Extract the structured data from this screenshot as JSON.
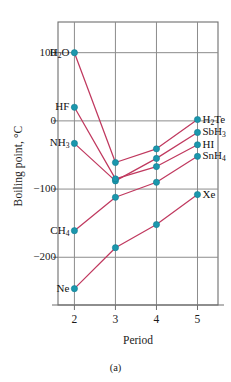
{
  "figure": {
    "caption": "(a)"
  },
  "axes": {
    "ylabel": "Boiling point, °C",
    "xlabel": "Period",
    "yticks": [
      "100",
      "0",
      "−100",
      "−200"
    ],
    "ytick_values": [
      100,
      0,
      -100,
      -200
    ],
    "xticks": [
      "2",
      "3",
      "4",
      "5"
    ],
    "xtick_values": [
      2,
      3,
      4,
      5
    ]
  },
  "colors": {
    "line": "#c0395f",
    "marker": "#1b97ad",
    "marker_edge": "#0f7c90",
    "grid": "#8c8c8c",
    "frame": "#6e6e6e",
    "text": "#1a1a1a",
    "background": "#ffffff"
  },
  "labels": {
    "left": [
      {
        "text": "H2O",
        "html": "H<sub>2</sub>O",
        "x": 2,
        "y": 100
      },
      {
        "text": "HF",
        "html": "HF",
        "x": 2,
        "y": 20
      },
      {
        "text": "NH3",
        "html": "NH<sub>3</sub>",
        "x": 2,
        "y": -33
      },
      {
        "text": "CH4",
        "html": "CH<sub>4</sub>",
        "x": 2,
        "y": -161
      },
      {
        "text": "Ne",
        "html": "Ne",
        "x": 2,
        "y": -246
      }
    ],
    "right": [
      {
        "text": "H2Te",
        "html": "H<sub>2</sub>Te",
        "x": 5,
        "y": 2
      },
      {
        "text": "SbH3",
        "html": "SbH<sub>3</sub>",
        "x": 5,
        "y": -17
      },
      {
        "text": "HI",
        "html": "HI",
        "x": 5,
        "y": -35
      },
      {
        "text": "SnH4",
        "html": "SnH<sub>4</sub>",
        "x": 5,
        "y": -52
      },
      {
        "text": "Xe",
        "html": "Xe",
        "x": 5,
        "y": -108
      }
    ]
  },
  "chart_data": {
    "type": "line",
    "title": "",
    "subtitle": "",
    "xlabel": "Period",
    "ylabel": "Boiling point, °C",
    "xlim": [
      1.6,
      5.5
    ],
    "ylim": [
      -270,
      145
    ],
    "grid": true,
    "legend": "none",
    "x": [
      2,
      3,
      4,
      5
    ],
    "series": [
      {
        "name": "Group 16 hydrides",
        "endpoint_label": "H2Te",
        "start_label": "H2O",
        "values": [
          100,
          -61,
          -41,
          2
        ],
        "points": [
          {
            "x": 2,
            "y": 100,
            "label": "H2O"
          },
          {
            "x": 3,
            "y": -61,
            "label": "H2S"
          },
          {
            "x": 4,
            "y": -41,
            "label": "H2Se"
          },
          {
            "x": 5,
            "y": 2,
            "label": "H2Te"
          }
        ]
      },
      {
        "name": "Group 15 hydrides",
        "endpoint_label": "SbH3",
        "start_label": "NH3",
        "values": [
          -33,
          -88,
          -55,
          -17
        ],
        "points": [
          {
            "x": 2,
            "y": -33,
            "label": "NH3"
          },
          {
            "x": 3,
            "y": -88,
            "label": "PH3"
          },
          {
            "x": 4,
            "y": -55,
            "label": "AsH3"
          },
          {
            "x": 5,
            "y": -17,
            "label": "SbH3"
          }
        ]
      },
      {
        "name": "Group 17 hydrides",
        "endpoint_label": "HI",
        "start_label": "HF",
        "values": [
          20,
          -85,
          -67,
          -35
        ],
        "points": [
          {
            "x": 2,
            "y": 20,
            "label": "HF"
          },
          {
            "x": 3,
            "y": -85,
            "label": "HCl"
          },
          {
            "x": 4,
            "y": -67,
            "label": "HBr"
          },
          {
            "x": 5,
            "y": -35,
            "label": "HI"
          }
        ]
      },
      {
        "name": "Group 14 hydrides",
        "endpoint_label": "SnH4",
        "start_label": "CH4",
        "values": [
          -161,
          -112,
          -90,
          -52
        ],
        "points": [
          {
            "x": 2,
            "y": -161,
            "label": "CH4"
          },
          {
            "x": 3,
            "y": -112,
            "label": "SiH4"
          },
          {
            "x": 4,
            "y": -90,
            "label": "GeH4"
          },
          {
            "x": 5,
            "y": -52,
            "label": "SnH4"
          }
        ]
      },
      {
        "name": "Noble gases",
        "endpoint_label": "Xe",
        "start_label": "Ne",
        "values": [
          -246,
          -186,
          -152,
          -108
        ],
        "points": [
          {
            "x": 2,
            "y": -246,
            "label": "Ne"
          },
          {
            "x": 3,
            "y": -186,
            "label": "Ar"
          },
          {
            "x": 4,
            "y": -152,
            "label": "Kr"
          },
          {
            "x": 5,
            "y": -108,
            "label": "Xe"
          }
        ]
      }
    ]
  }
}
